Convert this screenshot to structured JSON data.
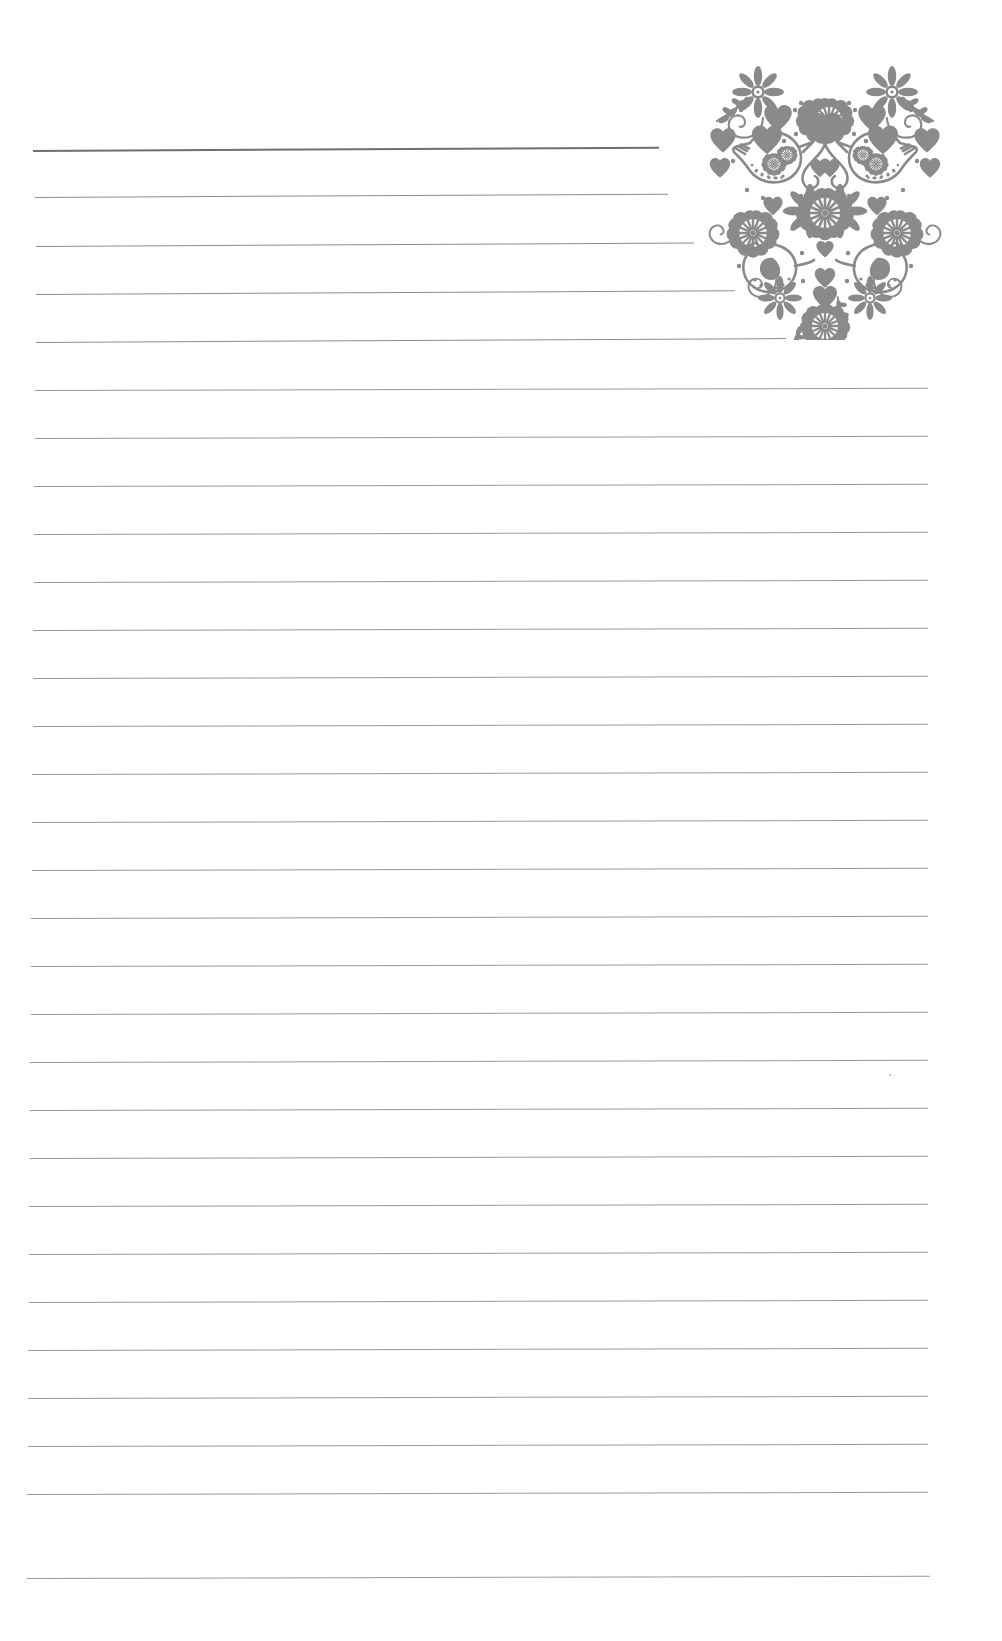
{
  "page": {
    "width": 1002,
    "height": 1641,
    "background_color": "#ffffff",
    "paper_type": "ruled-notepaper",
    "orientation": "portrait"
  },
  "decoration": {
    "name": "folk-art-heart",
    "description": "Scandinavian folk art heart made of birds, flowers, hearts and swirls",
    "color": "#8a8a8a",
    "position": {
      "left": 655,
      "top": 48,
      "width": 340,
      "height": 292
    },
    "motifs": [
      "bird-upper-left",
      "bird-upper-right",
      "bird-lower-left",
      "bird-lower-right",
      "daisy-flower",
      "rosette-flower",
      "heart",
      "swirl-scroll",
      "leaf-sprig",
      "dot"
    ]
  },
  "rules": {
    "color": "#9a9a9a",
    "first_line_color": "#6f6f6f",
    "left_margin": 38,
    "right_margin": 930,
    "first_line_y": 150,
    "line_spacing": 48,
    "line_count": 30,
    "lines": [
      {
        "index": 1,
        "y": 150,
        "x_start": 33,
        "x_end": 659,
        "weight": "heavy",
        "shortened": true
      },
      {
        "index": 2,
        "y": 197,
        "x_start": 35,
        "x_end": 668,
        "weight": "medium",
        "shortened": true
      },
      {
        "index": 3,
        "y": 246,
        "x_start": 36,
        "x_end": 694,
        "weight": "medium",
        "shortened": true
      },
      {
        "index": 4,
        "y": 294,
        "x_start": 36,
        "x_end": 735,
        "weight": "medium",
        "shortened": true
      },
      {
        "index": 5,
        "y": 342,
        "x_start": 36,
        "x_end": 786,
        "weight": "medium",
        "shortened": true
      },
      {
        "index": 6,
        "y": 390,
        "x_start": 35,
        "x_end": 928,
        "weight": "normal",
        "shortened": false
      },
      {
        "index": 7,
        "y": 438,
        "x_start": 35,
        "x_end": 928,
        "weight": "normal",
        "shortened": false
      },
      {
        "index": 8,
        "y": 486,
        "x_start": 34,
        "x_end": 928,
        "weight": "normal",
        "shortened": false
      },
      {
        "index": 9,
        "y": 534,
        "x_start": 34,
        "x_end": 928,
        "weight": "normal",
        "shortened": false
      },
      {
        "index": 10,
        "y": 582,
        "x_start": 34,
        "x_end": 928,
        "weight": "normal",
        "shortened": false
      },
      {
        "index": 11,
        "y": 630,
        "x_start": 33,
        "x_end": 928,
        "weight": "normal",
        "shortened": false
      },
      {
        "index": 12,
        "y": 678,
        "x_start": 33,
        "x_end": 928,
        "weight": "normal",
        "shortened": false
      },
      {
        "index": 13,
        "y": 726,
        "x_start": 33,
        "x_end": 928,
        "weight": "normal",
        "shortened": false
      },
      {
        "index": 14,
        "y": 774,
        "x_start": 32,
        "x_end": 928,
        "weight": "normal",
        "shortened": false
      },
      {
        "index": 15,
        "y": 822,
        "x_start": 32,
        "x_end": 928,
        "weight": "normal",
        "shortened": false
      },
      {
        "index": 16,
        "y": 870,
        "x_start": 32,
        "x_end": 928,
        "weight": "normal",
        "shortened": false
      },
      {
        "index": 17,
        "y": 918,
        "x_start": 31,
        "x_end": 928,
        "weight": "normal",
        "shortened": false
      },
      {
        "index": 18,
        "y": 966,
        "x_start": 31,
        "x_end": 928,
        "weight": "normal",
        "shortened": false
      },
      {
        "index": 19,
        "y": 1014,
        "x_start": 31,
        "x_end": 928,
        "weight": "normal",
        "shortened": false
      },
      {
        "index": 20,
        "y": 1062,
        "x_start": 30,
        "x_end": 928,
        "weight": "normal",
        "shortened": false
      },
      {
        "index": 21,
        "y": 1110,
        "x_start": 30,
        "x_end": 928,
        "weight": "normal",
        "shortened": false
      },
      {
        "index": 22,
        "y": 1158,
        "x_start": 30,
        "x_end": 928,
        "weight": "normal",
        "shortened": false
      },
      {
        "index": 23,
        "y": 1206,
        "x_start": 29,
        "x_end": 928,
        "weight": "normal",
        "shortened": false
      },
      {
        "index": 24,
        "y": 1254,
        "x_start": 29,
        "x_end": 928,
        "weight": "normal",
        "shortened": false
      },
      {
        "index": 25,
        "y": 1302,
        "x_start": 29,
        "x_end": 928,
        "weight": "normal",
        "shortened": false
      },
      {
        "index": 26,
        "y": 1350,
        "x_start": 28,
        "x_end": 928,
        "weight": "normal",
        "shortened": false
      },
      {
        "index": 27,
        "y": 1398,
        "x_start": 28,
        "x_end": 928,
        "weight": "normal",
        "shortened": false
      },
      {
        "index": 28,
        "y": 1446,
        "x_start": 28,
        "x_end": 928,
        "weight": "normal",
        "shortened": false
      },
      {
        "index": 29,
        "y": 1494,
        "x_start": 27,
        "x_end": 928,
        "weight": "normal",
        "shortened": false
      },
      {
        "index": 30,
        "y": 1578,
        "x_start": 27,
        "x_end": 930,
        "weight": "normal",
        "shortened": false
      }
    ]
  },
  "speck": {
    "name": "scan-speck",
    "x": 889,
    "y": 1074,
    "color": "#b4b4b4"
  }
}
